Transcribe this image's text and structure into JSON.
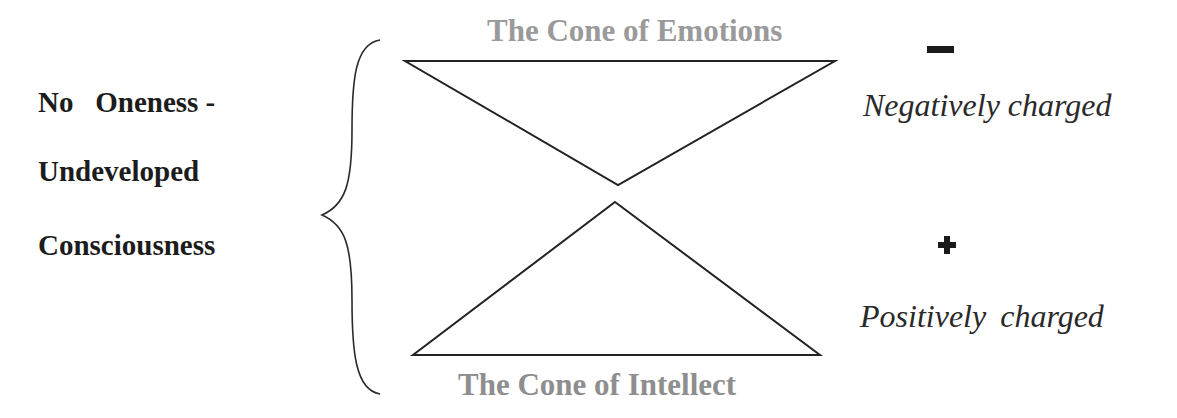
{
  "colors": {
    "title_gray": "#9a9a9a",
    "line": "#222222",
    "text": "#1c1c1c"
  },
  "left_label": {
    "lines": [
      "No   Oneness -",
      "Undeveloped",
      "Consciousness"
    ]
  },
  "cones": {
    "emotions": {
      "title": "The Cone of Emotions",
      "shape": "inverted-triangle"
    },
    "intellect": {
      "title": "The Cone of Intellect",
      "shape": "upright-triangle"
    }
  },
  "charges": {
    "negative": {
      "symbol": "minus-icon",
      "label": "Negatively charged"
    },
    "positive": {
      "symbol": "plus-icon",
      "label": "Positively charged"
    }
  }
}
